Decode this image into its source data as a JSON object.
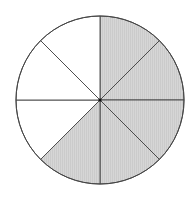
{
  "diagram": {
    "type": "fraction-circle",
    "total_sectors": 8,
    "shaded_sectors": 5,
    "fraction_shaded": "5/8",
    "center": [
      100,
      100
    ],
    "radius": 84,
    "start_angle_deg": -90,
    "direction": "clockwise",
    "sectors": [
      {
        "index": 0,
        "shaded": true
      },
      {
        "index": 1,
        "shaded": true
      },
      {
        "index": 2,
        "shaded": true
      },
      {
        "index": 3,
        "shaded": true
      },
      {
        "index": 4,
        "shaded": true
      },
      {
        "index": 5,
        "shaded": false
      },
      {
        "index": 6,
        "shaded": false
      },
      {
        "index": 7,
        "shaded": false
      }
    ],
    "colors": {
      "shaded": "#d2d2d2",
      "unshaded": "#ffffff",
      "stroke": "#444444"
    }
  }
}
